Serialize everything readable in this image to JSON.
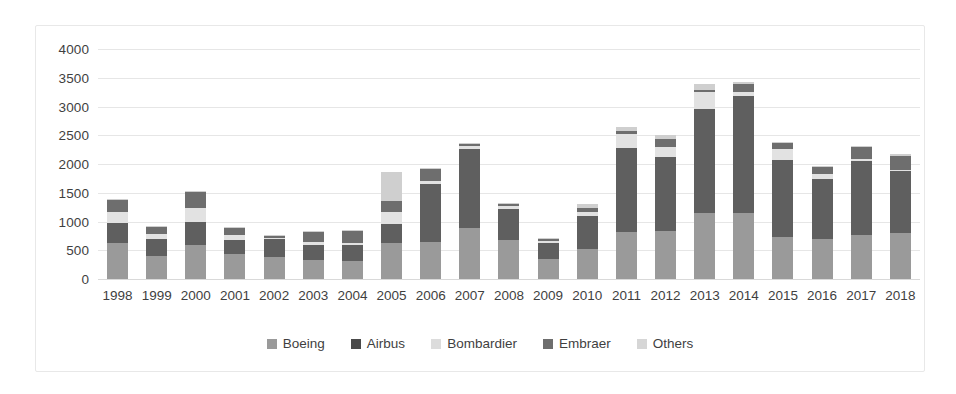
{
  "chart_data": {
    "type": "bar",
    "stacked": true,
    "title": "",
    "subtitle": "",
    "xlabel": "",
    "ylabel": "",
    "ylim": [
      0,
      4000
    ],
    "ytick_step": 500,
    "yticks": [
      4000,
      3500,
      3000,
      2500,
      2000,
      1500,
      1000,
      500,
      0
    ],
    "grid": true,
    "legend_position": "bottom",
    "categories": [
      "1998",
      "1999",
      "2000",
      "2001",
      "2002",
      "2003",
      "2004",
      "2005",
      "2006",
      "2007",
      "2008",
      "2009",
      "2010",
      "2011",
      "2012",
      "2013",
      "2014",
      "2015",
      "2016",
      "2017",
      "2018"
    ],
    "series": [
      {
        "name": "Boeing",
        "color": "#9a9a9a",
        "values": [
          620,
          400,
          590,
          440,
          380,
          330,
          310,
          620,
          650,
          890,
          670,
          350,
          530,
          810,
          830,
          1140,
          1150,
          730,
          690,
          770,
          800
        ]
      },
      {
        "name": "Airbus",
        "color": "#5f5f5f",
        "values": [
          350,
          290,
          410,
          230,
          310,
          270,
          280,
          340,
          1010,
          1370,
          550,
          280,
          570,
          1470,
          1290,
          1810,
          2040,
          1340,
          1050,
          1280,
          1080
        ]
      },
      {
        "name": "Bombardier",
        "color": "#e2e2e2",
        "values": [
          190,
          90,
          230,
          100,
          30,
          40,
          40,
          210,
          50,
          60,
          50,
          30,
          60,
          250,
          180,
          300,
          60,
          190,
          80,
          40,
          20
        ]
      },
      {
        "name": "Embraer",
        "color": "#6e6e6e",
        "values": [
          210,
          130,
          280,
          120,
          30,
          180,
          210,
          190,
          200,
          30,
          30,
          30,
          80,
          50,
          130,
          30,
          150,
          110,
          120,
          210,
          240
        ]
      },
      {
        "name": "Others",
        "color": "#cfcfcf",
        "values": [
          20,
          20,
          20,
          20,
          20,
          20,
          20,
          510,
          20,
          20,
          20,
          20,
          60,
          60,
          70,
          110,
          20,
          20,
          20,
          20,
          30
        ]
      }
    ]
  },
  "legend": {
    "items": [
      {
        "label": "Boeing",
        "color": "#9a9a9a"
      },
      {
        "label": "Airbus",
        "color": "#4a4a4a"
      },
      {
        "label": "Bombardier",
        "color": "#dcdcdc"
      },
      {
        "label": "Embraer",
        "color": "#6e6e6e"
      },
      {
        "label": "Others",
        "color": "#d6d6d6"
      }
    ]
  },
  "style": {
    "grid_color": "#e6e6e6",
    "axis_text_color": "#3f3f3f",
    "frame_border_color": "#e8e8e8",
    "background": "#ffffff"
  }
}
